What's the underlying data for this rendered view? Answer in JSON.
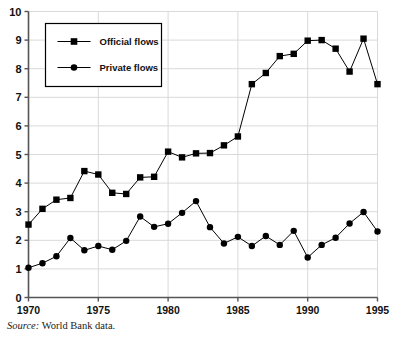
{
  "chart_data": {
    "type": "line",
    "title": "",
    "subtitle": "",
    "xlabel": "",
    "ylabel": "",
    "x": [
      1970,
      1971,
      1972,
      1973,
      1974,
      1975,
      1976,
      1977,
      1978,
      1979,
      1980,
      1981,
      1982,
      1983,
      1984,
      1985,
      1986,
      1987,
      1988,
      1989,
      1990,
      1991,
      1992,
      1993,
      1994,
      1995
    ],
    "xlim": [
      1970,
      1995
    ],
    "ylim": [
      0,
      10
    ],
    "xticks": [
      1970,
      1975,
      1980,
      1985,
      1990,
      1995
    ],
    "xtick_labels": [
      "1970",
      "1975",
      "1980",
      "1985",
      "1990",
      "1995"
    ],
    "yticks": [
      0,
      1,
      2,
      3,
      4,
      5,
      6,
      7,
      8,
      9,
      10
    ],
    "ytick_labels": [
      "0",
      "1",
      "2",
      "3",
      "4",
      "5",
      "6",
      "7",
      "8",
      "9",
      "10"
    ],
    "grid": true,
    "grid_color": "#d9d9d9",
    "legend_position": "top-left",
    "series": [
      {
        "name": "Official flows",
        "marker": "square",
        "color": "#000000",
        "values": [
          2.55,
          3.1,
          3.42,
          3.48,
          4.42,
          4.3,
          3.66,
          3.62,
          4.2,
          4.22,
          5.1,
          4.9,
          5.04,
          5.05,
          5.32,
          5.63,
          7.46,
          7.85,
          8.44,
          8.52,
          8.98,
          9.0,
          8.7,
          7.9,
          9.05,
          7.46
        ]
      },
      {
        "name": "Private flows",
        "marker": "circle",
        "color": "#000000",
        "values": [
          1.04,
          1.2,
          1.44,
          2.08,
          1.65,
          1.8,
          1.67,
          1.98,
          2.83,
          2.47,
          2.58,
          2.96,
          3.37,
          2.46,
          1.89,
          2.12,
          1.8,
          2.15,
          1.84,
          2.33,
          1.4,
          1.84,
          2.09,
          2.59,
          2.99,
          2.31
        ]
      }
    ]
  },
  "legend": {
    "items": [
      {
        "label": "Official flows",
        "marker": "square"
      },
      {
        "label": "Private flows",
        "marker": "circle"
      }
    ]
  },
  "source": {
    "prefix": "Source:",
    "text": "World Bank data."
  }
}
